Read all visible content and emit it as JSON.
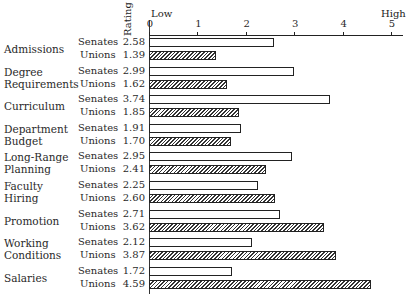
{
  "chart_data": {
    "type": "bar",
    "orientation": "horizontal",
    "title": "",
    "xlabel": "Rating",
    "axis_end_labels": {
      "low": "Low",
      "high": "High"
    },
    "xlim": [
      0,
      5
    ],
    "xticks": [
      "0",
      "1",
      "2",
      "3",
      "4",
      "5"
    ],
    "categories": [
      "Admissions",
      "Degree Requirements",
      "Curriculum",
      "Department Budget",
      "Long-Range Planning",
      "Faculty Hiring",
      "Promotion",
      "Working Conditions",
      "Salaries"
    ],
    "series": [
      {
        "name": "Senates",
        "pattern": "open",
        "values": [
          2.58,
          2.99,
          3.74,
          1.91,
          2.95,
          2.25,
          2.71,
          2.12,
          1.72
        ]
      },
      {
        "name": "Unions",
        "pattern": "hatched",
        "values": [
          1.39,
          1.62,
          1.85,
          1.7,
          2.41,
          2.6,
          3.62,
          3.87,
          4.59
        ]
      }
    ],
    "grid": false,
    "legend": "inline row labels"
  },
  "labels": {
    "rating": "Rating",
    "low": "Low",
    "high": "High",
    "senates": "Senates",
    "unions": "Unions"
  },
  "categories": [
    {
      "line1": "Admissions",
      "line2": "",
      "senates": "2.58",
      "unions": "1.39"
    },
    {
      "line1": "Degree",
      "line2": "Requirements",
      "senates": "2.99",
      "unions": "1.62"
    },
    {
      "line1": "Curriculum",
      "line2": "",
      "senates": "3.74",
      "unions": "1.85"
    },
    {
      "line1": "Department",
      "line2": "Budget",
      "senates": "1.91",
      "unions": "1.70"
    },
    {
      "line1": "Long-Range",
      "line2": "Planning",
      "senates": "2.95",
      "unions": "2.41"
    },
    {
      "line1": "Faculty",
      "line2": "Hiring",
      "senates": "2.25",
      "unions": "2.60"
    },
    {
      "line1": "Promotion",
      "line2": "",
      "senates": "2.71",
      "unions": "3.62"
    },
    {
      "line1": "Working",
      "line2": "Conditions",
      "senates": "2.12",
      "unions": "3.87"
    },
    {
      "line1": "Salaries",
      "line2": "",
      "senates": "1.72",
      "unions": "4.59"
    }
  ]
}
